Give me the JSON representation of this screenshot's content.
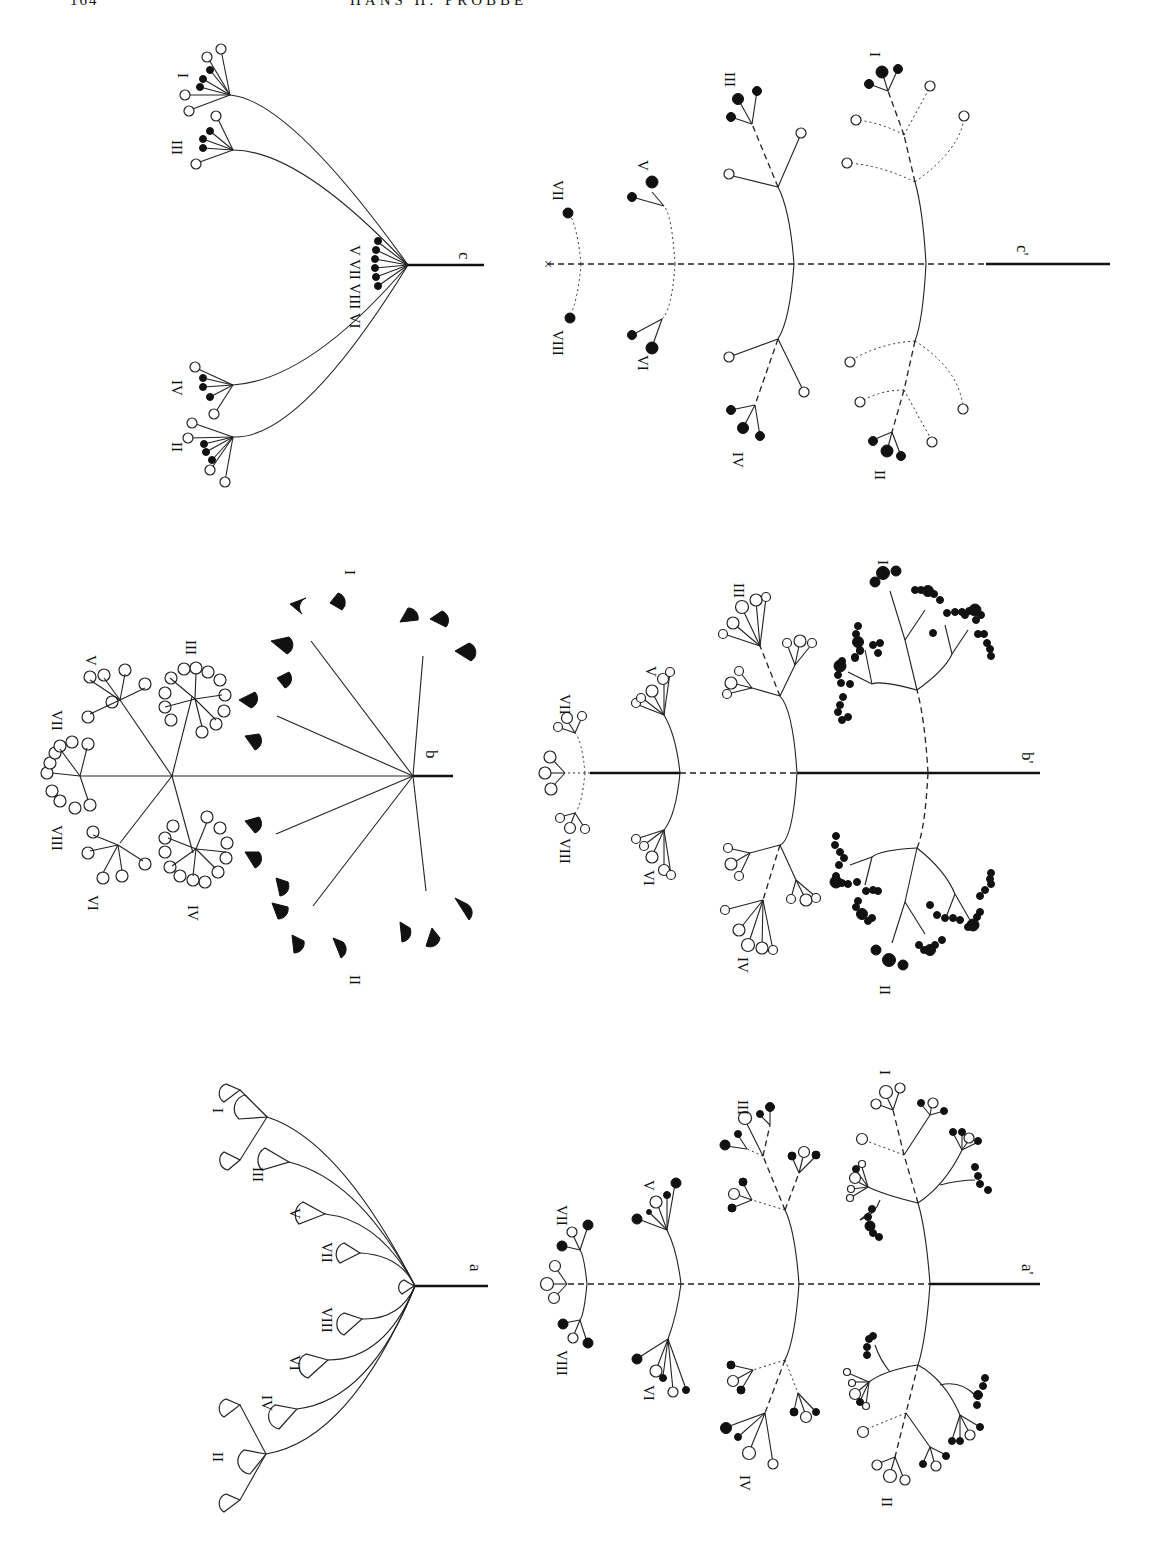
{
  "page": {
    "running_head": {
      "page_number": "164",
      "author": "HANS H. PROBBE"
    },
    "orientation": "rotated 90° clockwise",
    "figure": {
      "panels": [
        {
          "id": "a",
          "label": "a",
          "type": "umbel - primary rays with single flowers (cup symbols)",
          "ray_labels": [
            "I",
            "III",
            "V",
            "VII",
            "VIII",
            "VI",
            "IV",
            "II"
          ]
        },
        {
          "id": "b",
          "label": "b",
          "type": "compound umbel with filled cup flowers and open circle umbellets",
          "ray_labels": [
            "I",
            "III",
            "V",
            "VII",
            "VIII",
            "VI",
            "IV",
            "II"
          ]
        },
        {
          "id": "c",
          "label": "c",
          "type": "umbel with open and filled circle flowers",
          "ray_labels": [
            "I",
            "III",
            "V VII VIII VI",
            "IV",
            "II"
          ],
          "center_labels": [
            "V",
            "VII",
            "VIII",
            "VI"
          ]
        },
        {
          "id": "a_prime",
          "label": "a'",
          "type": "branched scheme with mixed open and filled flowers",
          "ray_labels": [
            "VII",
            "VIII",
            "V",
            "VI",
            "III",
            "IV",
            "I",
            "II"
          ]
        },
        {
          "id": "b_prime",
          "label": "b'",
          "type": "branched scheme, lower branches with filled flowers",
          "ray_labels": [
            "VII",
            "VIII",
            "V",
            "VI",
            "III",
            "IV",
            "I",
            "II"
          ]
        },
        {
          "id": "c_prime",
          "label": "c'",
          "type": "branched scheme with dashed reduced branches",
          "ray_labels": [
            "VII",
            "VIII",
            "V",
            "VI",
            "III",
            "IV",
            "I",
            "II"
          ],
          "terminal_marker": "×"
        }
      ]
    }
  }
}
